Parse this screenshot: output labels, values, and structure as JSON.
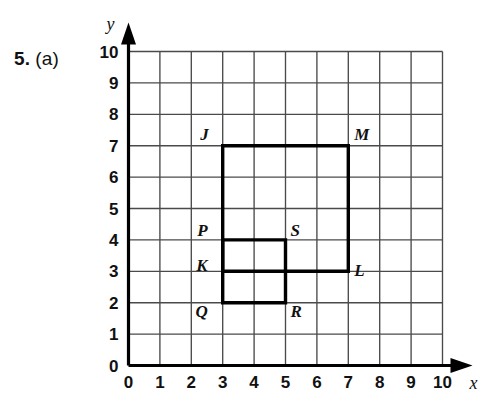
{
  "question": {
    "number": "5.",
    "part": "(a)"
  },
  "chart_data": {
    "type": "scatter",
    "title": "",
    "xlabel": "x",
    "ylabel": "y",
    "xlim": [
      0,
      10
    ],
    "ylim": [
      0,
      10
    ],
    "grid": true,
    "legend": "none",
    "xticks": [
      "0",
      "1",
      "2",
      "3",
      "4",
      "5",
      "6",
      "7",
      "8",
      "9",
      "10"
    ],
    "yticks": [
      "0",
      "1",
      "2",
      "3",
      "4",
      "5",
      "6",
      "7",
      "8",
      "9",
      "10"
    ],
    "points": [
      {
        "name": "J",
        "x": 3,
        "y": 7,
        "label_dx": -14,
        "label_dy": -6
      },
      {
        "name": "M",
        "x": 7,
        "y": 7,
        "label_dx": 6,
        "label_dy": -6
      },
      {
        "name": "L",
        "x": 7,
        "y": 3,
        "label_dx": 6,
        "label_dy": 5
      },
      {
        "name": "K",
        "x": 3,
        "y": 3,
        "label_dx": -15,
        "label_dy": 0
      },
      {
        "name": "P",
        "x": 3,
        "y": 4,
        "label_dx": -15,
        "label_dy": -4
      },
      {
        "name": "S",
        "x": 5,
        "y": 4,
        "label_dx": 5,
        "label_dy": -4
      },
      {
        "name": "R",
        "x": 5,
        "y": 2,
        "label_dx": 5,
        "label_dy": 14
      },
      {
        "name": "Q",
        "x": 3,
        "y": 2,
        "label_dx": -15,
        "label_dy": 14
      }
    ],
    "shapes": [
      {
        "name": "rectangle-JMLK",
        "vertices": [
          [
            3,
            7
          ],
          [
            7,
            7
          ],
          [
            7,
            3
          ],
          [
            3,
            3
          ]
        ],
        "closed": true
      },
      {
        "name": "rectangle-PSRQ",
        "vertices": [
          [
            3,
            4
          ],
          [
            5,
            4
          ],
          [
            5,
            2
          ],
          [
            3,
            2
          ]
        ],
        "closed": true
      }
    ],
    "colors": {
      "grid_line": "#4a4a4a",
      "axis": "#000000",
      "shape_outline": "#000000",
      "background": "#ffffff"
    }
  }
}
